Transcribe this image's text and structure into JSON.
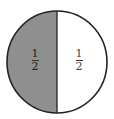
{
  "diagram": {
    "type": "fraction-circle",
    "parts": [
      {
        "position": "left",
        "shaded": true,
        "fill": "#8f8f8f",
        "numerator": "1",
        "denominator": "2"
      },
      {
        "position": "right",
        "shaded": false,
        "fill": "#ffffff",
        "numerator": "1",
        "denominator": "2"
      }
    ],
    "stroke": "#222222"
  }
}
